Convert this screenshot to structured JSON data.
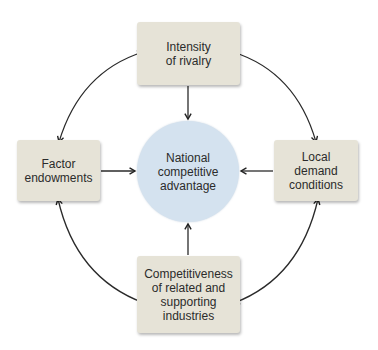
{
  "diagram": {
    "title": "",
    "center": {
      "label": "National\ncompetitive\nadvantage",
      "fill": "#d4e2ef"
    },
    "nodes": [
      {
        "id": "top",
        "label": "Intensity\nof rivalry",
        "fill": "#e6e3d7"
      },
      {
        "id": "left",
        "label": "Factor\nendowments",
        "fill": "#e6e3d7"
      },
      {
        "id": "right",
        "label": "Local\ndemand\nconditions",
        "fill": "#e6e3d7"
      },
      {
        "id": "bottom",
        "label": "Competitiveness\nof related and\nsupporting\nindustries",
        "fill": "#e6e3d7"
      }
    ],
    "edges": [
      {
        "from": "top",
        "to": "center",
        "type": "one-way"
      },
      {
        "from": "left",
        "to": "center",
        "type": "one-way"
      },
      {
        "from": "right",
        "to": "center",
        "type": "one-way"
      },
      {
        "from": "bottom",
        "to": "center",
        "type": "one-way"
      },
      {
        "from": "top",
        "to": "left",
        "type": "two-way"
      },
      {
        "from": "top",
        "to": "right",
        "type": "two-way"
      },
      {
        "from": "left",
        "to": "bottom",
        "type": "two-way"
      },
      {
        "from": "right",
        "to": "bottom",
        "type": "two-way"
      }
    ]
  }
}
